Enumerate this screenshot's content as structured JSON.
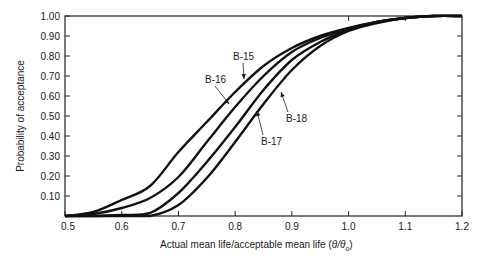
{
  "chart_data": {
    "type": "line",
    "title": "",
    "xlabel": "Actual mean life/acceptable mean life (θ/θ₀)",
    "xlabel_main": "Actual mean life/acceptable mean life (",
    "xlabel_theta": "θ/θ",
    "xlabel_sub": "o",
    "xlabel_close": ")",
    "ylabel": "Probability of acceptance",
    "xlim": [
      0.5,
      1.2
    ],
    "ylim": [
      0,
      1.0
    ],
    "grid": false,
    "legend": "inline labels with arrows",
    "x_ticks": [
      "0.5",
      "0.6",
      "0.7",
      "0.8",
      "0.9",
      "1.0",
      "1.1",
      "1.2"
    ],
    "x_tick_values": [
      0.5,
      0.6,
      0.7,
      0.8,
      0.9,
      1.0,
      1.1,
      1.2
    ],
    "y_ticks": [
      "0.10",
      "0.20",
      "0.30",
      "0.40",
      "0.50",
      "0.60",
      "0.70",
      "0.80",
      "0.90",
      "1.00"
    ],
    "y_tick_values": [
      0.1,
      0.2,
      0.3,
      0.4,
      0.5,
      0.6,
      0.7,
      0.8,
      0.9,
      1.0
    ],
    "x": [
      0.5,
      0.55,
      0.6,
      0.65,
      0.7,
      0.75,
      0.8,
      0.85,
      0.9,
      0.95,
      1.0,
      1.05,
      1.1,
      1.15,
      1.2
    ],
    "series": [
      {
        "name": "B-15",
        "values": [
          0.0,
          0.02,
          0.08,
          0.15,
          0.32,
          0.47,
          0.62,
          0.75,
          0.84,
          0.9,
          0.94,
          0.97,
          0.99,
          1.0,
          1.0
        ]
      },
      {
        "name": "B-16",
        "values": [
          0.0,
          0.01,
          0.04,
          0.09,
          0.195,
          0.37,
          0.545,
          0.7,
          0.82,
          0.89,
          0.935,
          0.97,
          0.99,
          1.0,
          1.0
        ]
      },
      {
        "name": "B-17",
        "values": [
          0.0,
          0.0,
          0.005,
          0.015,
          0.115,
          0.27,
          0.445,
          0.63,
          0.78,
          0.87,
          0.93,
          0.97,
          0.99,
          1.0,
          1.0
        ]
      },
      {
        "name": "B-18",
        "values": [
          0.0,
          0.0,
          0.0,
          0.0,
          0.055,
          0.19,
          0.37,
          0.56,
          0.73,
          0.85,
          0.925,
          0.965,
          0.99,
          1.0,
          1.0
        ]
      }
    ],
    "annotations": [
      {
        "text": "B-15",
        "x": 233,
        "y": 60,
        "arrow_to": [
          244,
          79
        ]
      },
      {
        "text": "B-16",
        "x": 205,
        "y": 83,
        "arrow_to": [
          229,
          104
        ]
      },
      {
        "text": "B-17",
        "x": 261,
        "y": 145,
        "arrow_to": [
          257,
          111
        ]
      },
      {
        "text": "B-18",
        "x": 286,
        "y": 122,
        "arrow_to": [
          281,
          92
        ]
      }
    ],
    "line_color": "#111111"
  }
}
